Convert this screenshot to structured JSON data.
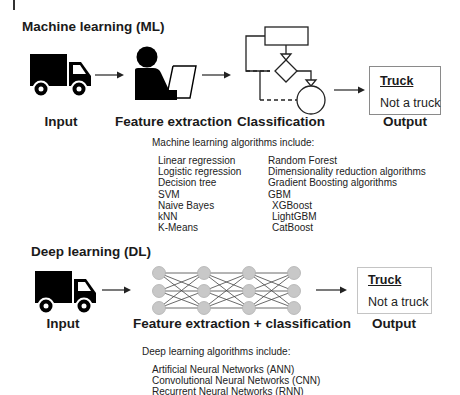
{
  "ml": {
    "title": "Machine learning (ML)",
    "stages": {
      "input": "Input",
      "feature_extraction": "Feature extraction",
      "classification": "Classification",
      "output": "Output"
    },
    "output_box": {
      "option_selected": "Truck",
      "option_other": "Not a truck"
    },
    "algorithms": {
      "heading": "Machine learning algorithms include:",
      "left_column": [
        "Linear regression",
        "Logistic regression",
        "Decision tree",
        "SVM",
        "Naive Bayes",
        "kNN",
        "K-Means"
      ],
      "right_column": [
        "Random Forest",
        "Dimensionality reduction algorithms",
        "Gradient Boosting algorithms",
        "GBM",
        "XGBoost",
        "LightGBM",
        "CatBoost"
      ]
    }
  },
  "dl": {
    "title": "Deep learning (DL)",
    "stages": {
      "input": "Input",
      "feature_extraction_classification": "Feature extraction + classification",
      "output": "Output"
    },
    "output_box": {
      "option_selected": "Truck",
      "option_other": "Not a truck"
    },
    "algorithms": {
      "heading": "Deep learning algorithms include:",
      "items": [
        "Artificial Neural Networks (ANN)",
        "Convolutional Neural Networks (CNN)",
        "Recurrent Neural Networks (RNN)"
      ]
    }
  },
  "icons": {
    "truck": "truck-icon",
    "person_laptop": "person-with-laptop-icon",
    "flowchart": "flowchart-icon",
    "neural_network": "neural-network-icon",
    "arrow": "arrow-right-icon"
  },
  "colors": {
    "icon_fill": "#000000",
    "node_fill": "#c8c8c8",
    "node_stroke": "#b0b0b0",
    "output_border_ml": "#8a8a8a",
    "output_border_dl": "#c4c4c4"
  }
}
